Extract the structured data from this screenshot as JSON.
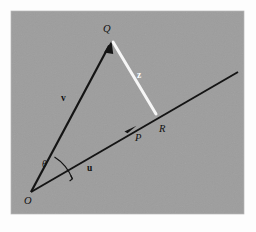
{
  "figure": {
    "panel_color": "#9d9d9d",
    "page_color": "#fdfdfd",
    "stroke_dark": "#141414",
    "stroke_light": "#f6f6f6"
  },
  "panel": {
    "x": 11,
    "y": 11,
    "width": 233,
    "height": 203
  },
  "points": {
    "O": {
      "label": "O",
      "x": 31,
      "y": 192,
      "label_x": 24,
      "label_y": 203
    },
    "Q": {
      "label": "Q",
      "x": 111,
      "y": 42,
      "label_x": 105,
      "label_y": 31
    },
    "P": {
      "label": "P",
      "x": 133,
      "y": 128,
      "label_x": 137,
      "label_y": 140
    },
    "R": {
      "label": "R",
      "x": 156,
      "y": 114,
      "label_x": 161,
      "label_y": 131
    }
  },
  "vectors": [
    {
      "name": "v",
      "label": "v",
      "color": "#141414",
      "from_x": 31,
      "from_y": 192,
      "to_x": 111,
      "to_y": 42,
      "label_x": 64,
      "label_y": 100,
      "arrow": true,
      "width": 2.2
    },
    {
      "name": "u",
      "label": "u",
      "color": "#141414",
      "from_x": 31,
      "from_y": 192,
      "to_x": 238,
      "to_y": 72,
      "label_x": 89,
      "label_y": 170,
      "arrow": true,
      "arrow_at_x": 133,
      "arrow_at_y": 128,
      "width": 2.0
    },
    {
      "name": "z",
      "label": "z",
      "color": "#f6f6f6",
      "from_x": 113,
      "from_y": 42,
      "to_x": 156,
      "to_y": 114,
      "label_x": 139,
      "label_y": 77,
      "arrow": false,
      "width": 3.0
    }
  ],
  "angle": {
    "label": "θ",
    "label_x": 44,
    "label_y": 165,
    "vertex_x": 31,
    "vertex_y": 192,
    "radius": 44,
    "arc_path": "M 54.48 156.94 A 44 44 0 0 1 72.31 178.88",
    "tick_path": "M 70.0 180.8 L 72.3 178.9 L 70.9 176.0"
  },
  "labels": {
    "origin": "O",
    "apex": "Q",
    "mid": "P",
    "foot": "R",
    "vec_v": "v",
    "vec_u": "u",
    "vec_z": "z",
    "theta": "θ"
  }
}
